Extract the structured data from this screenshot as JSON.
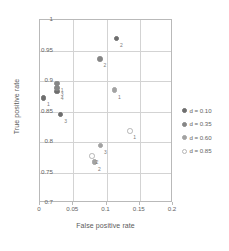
{
  "chart_data": {
    "type": "scatter",
    "title": "",
    "xlabel": "False positive rate",
    "ylabel": "True positive rate",
    "xlim": [
      0,
      0.2
    ],
    "ylim": [
      0.7,
      1
    ],
    "xticks": [
      "0",
      "0.05",
      "0.1",
      "0.15",
      "0.2"
    ],
    "xtick_values": [
      0,
      0.05,
      0.1,
      0.15,
      0.2
    ],
    "yticks": [
      "0.7",
      "0.75",
      "0.8",
      "0.85",
      "0.9",
      "0.95",
      "1"
    ],
    "ytick_values": [
      0.7,
      0.75,
      0.8,
      0.85,
      0.9,
      0.95,
      1
    ],
    "grid": true,
    "legend_position": "right",
    "legend_title": "",
    "series": [
      {
        "name": "d = 0.10",
        "label": "d = 0.10",
        "color": "#6e6e6e",
        "filled": true,
        "points": [
          {
            "label": "1",
            "x": 0.005,
            "y": 0.872
          },
          {
            "label": "2",
            "x": 0.115,
            "y": 0.97
          },
          {
            "label": "3",
            "x": 0.031,
            "y": 0.845
          },
          {
            "label": "4",
            "x": 0.026,
            "y": 0.883
          }
        ]
      },
      {
        "name": "d = 0.35",
        "label": "d = 0.35",
        "color": "#868686",
        "filled": true,
        "points": [
          {
            "label": "1",
            "x": 0.026,
            "y": 0.896
          },
          {
            "label": "2",
            "x": 0.09,
            "y": 0.936
          },
          {
            "label": "3",
            "x": 0.026,
            "y": 0.889
          }
        ]
      },
      {
        "name": "d = 0.60",
        "label": "d = 0.60",
        "color": "#a2a2a2",
        "filled": true,
        "points": [
          {
            "label": "1",
            "x": 0.112,
            "y": 0.885
          },
          {
            "label": "2",
            "x": 0.082,
            "y": 0.767
          },
          {
            "label": "3",
            "x": 0.091,
            "y": 0.794
          }
        ]
      },
      {
        "name": "d = 0.85",
        "label": "d = 0.85",
        "color": "#b5b5b5",
        "filled": false,
        "points": [
          {
            "label": "1",
            "x": 0.135,
            "y": 0.818
          },
          {
            "label": "2",
            "x": 0.078,
            "y": 0.777
          }
        ]
      }
    ]
  }
}
